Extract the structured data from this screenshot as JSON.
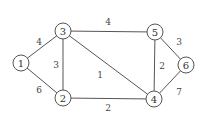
{
  "graph": {
    "nodes": [
      {
        "id": "1",
        "label": "1",
        "x": 21,
        "y": 63
      },
      {
        "id": "2",
        "label": "2",
        "x": 63,
        "y": 98
      },
      {
        "id": "3",
        "label": "3",
        "x": 63,
        "y": 31
      },
      {
        "id": "4",
        "label": "4",
        "x": 154,
        "y": 99
      },
      {
        "id": "5",
        "label": "5",
        "x": 155,
        "y": 32
      },
      {
        "id": "6",
        "label": "6",
        "x": 186,
        "y": 65
      }
    ],
    "edges": [
      {
        "from": "1",
        "to": "3",
        "weight": "4",
        "lx": 39,
        "ly": 42
      },
      {
        "from": "1",
        "to": "2",
        "weight": "6",
        "lx": 39,
        "ly": 90
      },
      {
        "from": "3",
        "to": "2",
        "weight": "3",
        "lx": 56,
        "ly": 65
      },
      {
        "from": "3",
        "to": "5",
        "weight": "4",
        "lx": 108,
        "ly": 22
      },
      {
        "from": "3",
        "to": "4",
        "weight": "1",
        "lx": 100,
        "ly": 75
      },
      {
        "from": "2",
        "to": "4",
        "weight": "2",
        "lx": 108,
        "ly": 108
      },
      {
        "from": "5",
        "to": "4",
        "weight": "2",
        "lx": 162,
        "ly": 66
      },
      {
        "from": "5",
        "to": "6",
        "weight": "3",
        "lx": 179,
        "ly": 42
      },
      {
        "from": "6",
        "to": "4",
        "weight": "7",
        "lx": 179,
        "ly": 92
      }
    ]
  }
}
